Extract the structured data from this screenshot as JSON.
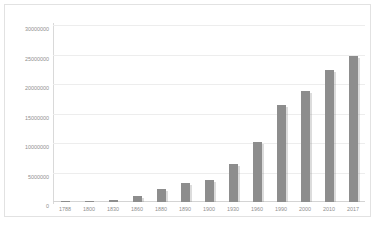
{
  "chart_data": {
    "type": "bar",
    "title": "",
    "xlabel": "",
    "ylabel": "",
    "ylim": [
      0,
      30000000
    ],
    "grid": true,
    "legend": false,
    "categories": [
      "1788",
      "1800",
      "1830",
      "1860",
      "1880",
      "1890",
      "1900",
      "1930",
      "1960",
      "1990",
      "2000",
      "2010",
      "2017"
    ],
    "values": [
      30000,
      100000,
      300000,
      1000000,
      2200000,
      3200000,
      3800000,
      6400000,
      10200000,
      16500000,
      18900000,
      22300000,
      24800000
    ],
    "ytick_labels": [
      "30000000",
      "25000000",
      "20000000",
      "15000000",
      "10000000",
      "5000000",
      "0"
    ],
    "ytick_values": [
      30000000,
      25000000,
      20000000,
      15000000,
      10000000,
      5000000,
      0
    ],
    "series_color": "#8d8d8d",
    "gridline_color": "#ededed",
    "axis_color": "#d9d9d9",
    "label_color": "#8f8f8f"
  },
  "caption": {
    "text": ""
  }
}
